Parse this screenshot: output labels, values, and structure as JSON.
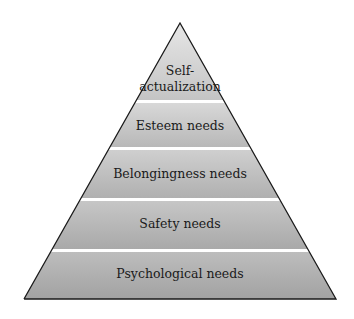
{
  "diagram": {
    "title": "",
    "type": "pyramid",
    "levels": [
      {
        "label_lines": [
          "Self-",
          "actualization"
        ]
      },
      {
        "label": "Esteem needs"
      },
      {
        "label": "Belongingness needs"
      },
      {
        "label": "Safety needs"
      },
      {
        "label": "Psychological needs"
      }
    ],
    "colors": {
      "fill_top": "#e0e0e0",
      "fill_bottom": "#a6a6a6",
      "separator": "#ffffff",
      "outline": "#1a1a1a",
      "text": "#1a1a1a"
    }
  }
}
